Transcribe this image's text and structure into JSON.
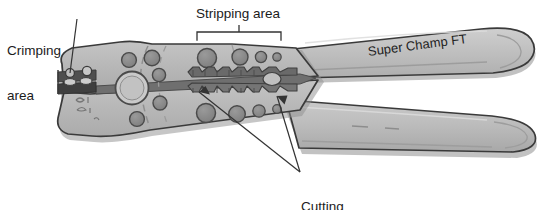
{
  "figure": {
    "background_color": "#ffffff",
    "annotation_color": "#1b1b1b"
  },
  "labels": {
    "crimping": "Crimping\narea",
    "crimping_line1": "Crimping",
    "crimping_line2": "area",
    "stripping": "Stripping area",
    "cutting": "Cutting\narea",
    "cutting_line1": "Cutting",
    "cutting_line2": "area",
    "brand": "Super Champ FT"
  },
  "colors": {
    "body_fill": "#b9b9b9",
    "body_fill_light": "#c6c6c6",
    "body_fill_dark": "#a6a6a6",
    "outline": "#3a3a3a",
    "hole_fill": "#8a8a8a",
    "hole_stroke": "#4a4a4a",
    "jaw_dark": "#6d6d6d",
    "jaw_darker": "#555555",
    "handle_fill": "#bdbdbd",
    "handle_highlight": "#d2d2d2",
    "shadow": "#9a9a9a",
    "leader": "#333333",
    "text": "#1b1b1b"
  },
  "parts": {
    "upper_handle": "Super Champ FT upper handle",
    "lower_handle": "lower handle",
    "pivot": "pivot-rivet-circle",
    "crimping_jaw": "crimping jaw nest at nose",
    "stripping_notches": "serrated stripping gauge notches",
    "cutting_edge": "cutting blades at jaw throat"
  },
  "annotations": [
    {
      "name": "crimping",
      "text": "Crimping area",
      "leader": "from text down-right to nose crimping nest"
    },
    {
      "name": "stripping",
      "text": "Stripping area",
      "leader": "square bracket spanning the serrated notch region"
    },
    {
      "name": "cutting",
      "text": "Cutting area",
      "leader": "two lines up-left to the two cutting blade arrows"
    }
  ],
  "holes": {
    "upper_row": [
      9.5,
      8.0,
      5.5,
      4.2
    ],
    "lower_row": [
      9.5,
      8.0,
      6.0,
      4.2
    ],
    "pivot_radius": 16
  }
}
